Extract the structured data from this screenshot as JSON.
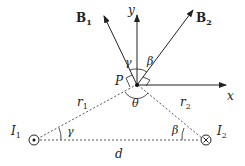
{
  "diagram": {
    "type": "magnetic field of two parallel currents at point P",
    "labels": {
      "B1": "B",
      "B1_sub": "1",
      "B2": "B",
      "B2_sub": "2",
      "y_axis": "y",
      "x_axis": "x",
      "point": "P",
      "gamma_top": "γ",
      "beta_top": "β",
      "theta": "θ",
      "r1": "r",
      "r1_sub": "1",
      "r2": "r",
      "r2_sub": "2",
      "I1": "I",
      "I1_sub": "1",
      "I2": "I",
      "I2_sub": "2",
      "gamma_bottom": "γ",
      "beta_bottom": "β",
      "d": "d"
    },
    "currents": [
      {
        "name": "I1",
        "direction": "out-of-page (dot)"
      },
      {
        "name": "I2",
        "direction": "into-page (cross)"
      }
    ]
  }
}
